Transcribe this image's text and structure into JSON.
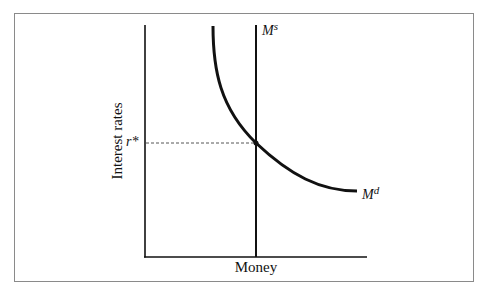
{
  "figure": {
    "y_axis_label": "Interest rates",
    "x_axis_label": "Money",
    "equilibrium_label": "r*",
    "supply_label": {
      "base": "M",
      "sup": "s"
    },
    "demand_label": {
      "base": "M",
      "sup": "d"
    }
  },
  "colors": {
    "line": "#111111",
    "frame": "#8a8a8a",
    "dashed": "#555555"
  }
}
